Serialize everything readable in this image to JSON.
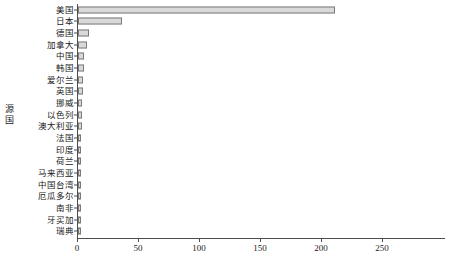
{
  "chart_data": {
    "type": "bar",
    "orientation": "horizontal",
    "title": "",
    "xlabel": "",
    "ylabel": "源国",
    "xlim": [
      0,
      250
    ],
    "ylim": null,
    "grid": false,
    "legend": null,
    "xticks": [
      0,
      50,
      100,
      150,
      200,
      250
    ],
    "xtick_labels": [
      "0",
      "50",
      "100",
      "150",
      "200",
      "250"
    ],
    "categories": [
      "美国",
      "日本",
      "德国",
      "加拿大",
      "中国",
      "韩国",
      "爱尔兰",
      "英国",
      "挪威",
      "以色列",
      "澳大利亚",
      "法国",
      "印度",
      "荷兰",
      "马来西亚",
      "中国台湾",
      "厄瓜多尔",
      "南非",
      "牙买加",
      "瑞典"
    ],
    "values": [
      211,
      36,
      9,
      7,
      5,
      5,
      4,
      4,
      3,
      3,
      3,
      2,
      2,
      2,
      1,
      1,
      1,
      1,
      1,
      1
    ],
    "series": [
      {
        "name": "源国",
        "values": [
          211,
          36,
          9,
          7,
          5,
          5,
          4,
          4,
          3,
          3,
          3,
          2,
          2,
          2,
          1,
          1,
          1,
          1,
          1,
          1
        ]
      }
    ],
    "bar_fill_color": "#d9d9d9",
    "bar_border_color": "#7a7a7a",
    "axis_color": "#4d4d4d"
  },
  "caption": "",
  "y_axis_title_chars": [
    "源",
    "国"
  ]
}
